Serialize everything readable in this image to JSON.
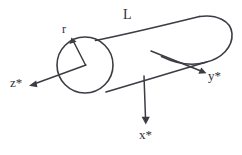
{
  "figure": {
    "kind": "cylinder-coordinate-diagram",
    "background_color": "#ffffff",
    "line_color": "#3c3c44",
    "labels": {
      "length": "L",
      "radius": "r",
      "axis_x": "x*",
      "axis_y": "y*",
      "axis_z": "z*"
    },
    "geometry": {
      "left_cap": {
        "center_x": 85,
        "center_y": 65,
        "radius_x": 28,
        "radius_y": 28
      },
      "top_edge": {
        "x1": 96,
        "y1": 40,
        "x2": 205,
        "y2": 17
      },
      "bottom_edge": {
        "x1": 106,
        "y1": 92,
        "x2": 206,
        "y2": 62
      },
      "right_cap_kind": "rounded-arc",
      "axes": [
        {
          "name": "x*",
          "from_x": 143,
          "from_y": 76,
          "to_x": 147,
          "to_y": 123
        },
        {
          "name": "y*",
          "from_x": 151,
          "from_y": 51,
          "to_x": 206,
          "to_y": 73
        },
        {
          "name": "z*",
          "from_x": 85,
          "from_y": 65,
          "to_x": 30,
          "to_y": 85
        },
        {
          "name": "r",
          "from_x": 85,
          "from_y": 65,
          "to_x": 72,
          "to_y": 39
        }
      ]
    }
  }
}
